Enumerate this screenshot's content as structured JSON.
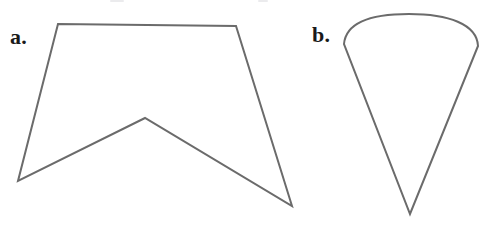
{
  "figure": {
    "background_color": "#ffffff",
    "stroke_color": "#6b6b6b",
    "label_color": "#1a1a1a",
    "stroke_width": 2,
    "width": 498,
    "height": 231,
    "panels": [
      {
        "id": "a",
        "label": "a.",
        "shape_name": "concave-pentagon-pennant",
        "description": "Concave five-sided polygon resembling a banner or pennant with a notch cut into the bottom edge",
        "vertices": [
          [
            58,
            24
          ],
          [
            236,
            26
          ],
          [
            292,
            206
          ],
          [
            145,
            118
          ],
          [
            18,
            181
          ]
        ],
        "path": "M58,24 L236,26 L292,206 L145,118 L18,181 Z"
      },
      {
        "id": "b",
        "label": "b.",
        "shape_name": "cone-teardrop",
        "description": "Cone or teardrop shape: a rounded convex arc across the top closing into a sharp V apex at the bottom",
        "apex": [
          410,
          214
        ],
        "arc_top": [
          409,
          14
        ],
        "arc_left": [
          344,
          44
        ],
        "arc_right": [
          478,
          46
        ],
        "path": "M344,44 C346,22 372,14 409,14 C448,14 477,24 478,46 L410,214 Z"
      }
    ],
    "crop_artifacts": [
      {
        "left": 110,
        "width": 14
      },
      {
        "left": 258,
        "width": 10
      }
    ]
  }
}
